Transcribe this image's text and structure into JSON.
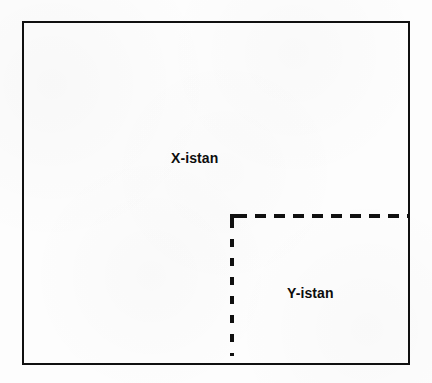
{
  "diagram": {
    "type": "region-partition-diagram",
    "canvas": {
      "width": 432,
      "height": 383,
      "background_color": "#fdfdfd"
    },
    "outer_region": {
      "name": "X-istan",
      "label": "X-istan",
      "border_style": "solid",
      "border_color": "#101010",
      "border_width_px": 2.5,
      "bounds": {
        "x": 22,
        "y": 21,
        "width": 388,
        "height": 344
      }
    },
    "inner_region": {
      "name": "Y-istan",
      "label": "Y-istan",
      "border_style": "dashed",
      "border_color": "#101010",
      "border_width_px": 4,
      "position": "bottom-right",
      "boundary_segments": [
        {
          "id": "horizontal",
          "orientation": "horizontal",
          "x": 230,
          "y": 214,
          "length": 180,
          "dash_px": 11,
          "gap_px": 8
        },
        {
          "id": "vertical",
          "orientation": "vertical",
          "x": 230,
          "y": 214,
          "length": 142,
          "dash_px": 8,
          "gap_px": 11
        }
      ]
    },
    "labels": [
      {
        "id": "x-istan",
        "text": "X-istan",
        "x": 200,
        "y": 158,
        "bold": true,
        "font_size": 14
      },
      {
        "id": "y-istan",
        "text": "Y-istan",
        "x": 316,
        "y": 293,
        "bold": true,
        "font_size": 14
      }
    ]
  }
}
